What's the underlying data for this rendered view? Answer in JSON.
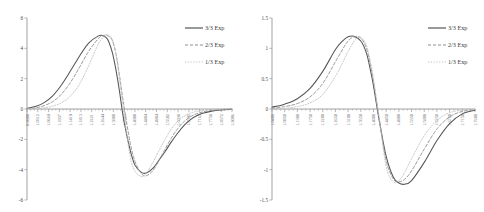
{
  "figure": {
    "panel_count": 2,
    "background": "#ffffff",
    "curve_colors": {
      "exp_3_3": "#555555",
      "exp_2_3": "#8d8d8d",
      "exp_1_3": "#c2c2c2"
    }
  },
  "legend": {
    "position": "top-right",
    "entries": [
      {
        "label": "3/3 Exp",
        "style": "solid"
      },
      {
        "label": "2/3 Exp",
        "style": "dashed"
      },
      {
        "label": "1/3 Exp",
        "style": "dotted"
      }
    ]
  },
  "chart_data": [
    {
      "type": "line",
      "panel": "left",
      "title": "",
      "xlabel": "",
      "ylabel": "",
      "ylim": [
        -6,
        6
      ],
      "yticks": [
        "6",
        "4",
        "2",
        "0",
        "-2",
        "-4",
        "-6"
      ],
      "ytick_values": [
        6,
        4,
        2,
        0,
        -2,
        -4,
        -6
      ],
      "grid": false,
      "legend_position": "top-right",
      "xtick_labels": [
        "0.9908",
        "1.0312",
        "1.0669",
        "1.1037",
        "1.1419",
        "1.1813",
        "1.2221",
        "1.2644",
        "1.3080",
        "1.3532",
        "1.4000",
        "1.4484",
        "1.4984",
        "1.5502",
        "1.6038",
        "1.6592",
        "1.7165",
        "1.7758",
        "1.8372",
        "1.9006"
      ],
      "xlim": [
        0.9908,
        1.9006
      ],
      "series": [
        {
          "name": "3/3 Exp",
          "style": "solid",
          "x": [
            0.9908,
            1.0312,
            1.0669,
            1.1037,
            1.1419,
            1.1813,
            1.2221,
            1.2644,
            1.308,
            1.325,
            1.342,
            1.3532,
            1.37,
            1.386,
            1.4,
            1.42,
            1.4484,
            1.47,
            1.4984,
            1.52,
            1.5502,
            1.58,
            1.6038,
            1.63,
            1.6592,
            1.69,
            1.7165,
            1.75,
            1.7758,
            1.81,
            1.8372,
            1.87,
            1.9006
          ],
          "y": [
            0.05,
            0.18,
            0.42,
            0.85,
            1.55,
            2.45,
            3.45,
            4.35,
            4.82,
            4.85,
            4.7,
            4.45,
            3.7,
            2.55,
            1.3,
            -0.7,
            -2.7,
            -3.7,
            -4.18,
            -4.22,
            -3.9,
            -3.3,
            -2.8,
            -2.2,
            -1.6,
            -1.05,
            -0.7,
            -0.4,
            -0.26,
            -0.14,
            -0.08,
            -0.04,
            -0.02
          ]
        },
        {
          "name": "2/3 Exp",
          "style": "dashed",
          "x": [
            0.9908,
            1.0312,
            1.0669,
            1.1037,
            1.1419,
            1.1813,
            1.2221,
            1.2644,
            1.308,
            1.33,
            1.3532,
            1.37,
            1.386,
            1.4,
            1.42,
            1.4484,
            1.47,
            1.4984,
            1.52,
            1.5502,
            1.58,
            1.6038,
            1.63,
            1.6592,
            1.69,
            1.7165,
            1.75,
            1.7758,
            1.81,
            1.8372,
            1.87,
            1.9006
          ],
          "y": [
            0.02,
            0.08,
            0.22,
            0.48,
            0.95,
            1.7,
            2.7,
            3.8,
            4.65,
            4.85,
            4.8,
            4.5,
            3.6,
            2.35,
            0.3,
            -2.2,
            -3.45,
            -4.25,
            -4.4,
            -4.05,
            -3.3,
            -2.65,
            -1.95,
            -1.3,
            -0.8,
            -0.5,
            -0.28,
            -0.18,
            -0.09,
            -0.05,
            -0.02,
            -0.01
          ]
        },
        {
          "name": "1/3 Exp",
          "style": "dotted",
          "x": [
            0.9908,
            1.0312,
            1.0669,
            1.1037,
            1.1419,
            1.1813,
            1.2221,
            1.2644,
            1.308,
            1.34,
            1.3532,
            1.37,
            1.386,
            1.4,
            1.42,
            1.4484,
            1.47,
            1.4984,
            1.52,
            1.5502,
            1.58,
            1.6038,
            1.63,
            1.6592,
            1.69,
            1.7165,
            1.75,
            1.7758,
            1.81,
            1.8372,
            1.87,
            1.9006
          ],
          "y": [
            0.01,
            0.03,
            0.08,
            0.18,
            0.4,
            0.82,
            1.6,
            2.85,
            4.3,
            4.88,
            4.85,
            4.55,
            3.55,
            2.1,
            -0.2,
            -3.1,
            -4.1,
            -4.45,
            -4.25,
            -3.5,
            -2.65,
            -2.0,
            -1.35,
            -0.82,
            -0.45,
            -0.27,
            -0.14,
            -0.08,
            -0.04,
            -0.02,
            -0.01,
            0.0
          ]
        }
      ]
    },
    {
      "type": "line",
      "panel": "right",
      "title": "",
      "xlabel": "",
      "ylabel": "",
      "ylim": [
        -1.5,
        1.5
      ],
      "yticks": [
        "1.5",
        "1",
        "0.5",
        "0",
        "-0.5",
        "-1",
        "-1.5"
      ],
      "ytick_values": [
        1.5,
        1,
        0.5,
        0,
        -0.5,
        -1,
        -1.5
      ],
      "grid": false,
      "legend_position": "top-right",
      "xtick_labels": [
        "1.0400",
        "1.0850",
        "1.1300",
        "1.1750",
        "1.2200",
        "1.2650",
        "1.3100",
        "1.3550",
        "1.4000",
        "1.4450",
        "1.4900",
        "1.5350",
        "1.5800",
        "1.6250",
        "1.6700",
        "1.7150",
        "1.7600"
      ],
      "xlim": [
        1.04,
        1.76
      ],
      "series": [
        {
          "name": "3/3 Exp",
          "style": "solid",
          "x": [
            1.04,
            1.085,
            1.13,
            1.175,
            1.22,
            1.265,
            1.29,
            1.31,
            1.33,
            1.355,
            1.375,
            1.39,
            1.4,
            1.42,
            1.445,
            1.47,
            1.49,
            1.51,
            1.535,
            1.58,
            1.625,
            1.67,
            1.715,
            1.76
          ],
          "y": [
            0.03,
            0.08,
            0.17,
            0.34,
            0.62,
            0.98,
            1.12,
            1.19,
            1.2,
            1.12,
            0.92,
            0.62,
            0.38,
            -0.18,
            -0.78,
            -1.12,
            -1.22,
            -1.24,
            -1.18,
            -0.88,
            -0.52,
            -0.24,
            -0.08,
            -0.02
          ]
        },
        {
          "name": "2/3 Exp",
          "style": "dashed",
          "x": [
            1.04,
            1.085,
            1.13,
            1.175,
            1.22,
            1.265,
            1.29,
            1.31,
            1.33,
            1.355,
            1.375,
            1.39,
            1.4,
            1.42,
            1.445,
            1.47,
            1.49,
            1.51,
            1.535,
            1.58,
            1.625,
            1.67,
            1.715,
            1.76
          ],
          "y": [
            0.01,
            0.04,
            0.09,
            0.2,
            0.42,
            0.78,
            0.98,
            1.12,
            1.19,
            1.17,
            1.0,
            0.7,
            0.45,
            -0.15,
            -0.85,
            -1.15,
            -1.2,
            -1.16,
            -1.02,
            -0.66,
            -0.33,
            -0.13,
            -0.04,
            -0.01
          ]
        },
        {
          "name": "1/3 Exp",
          "style": "dotted",
          "x": [
            1.04,
            1.085,
            1.13,
            1.175,
            1.22,
            1.265,
            1.29,
            1.31,
            1.335,
            1.355,
            1.375,
            1.39,
            1.4,
            1.42,
            1.445,
            1.47,
            1.49,
            1.51,
            1.535,
            1.58,
            1.625,
            1.67,
            1.715,
            1.76
          ],
          "y": [
            0.0,
            0.01,
            0.04,
            0.1,
            0.24,
            0.54,
            0.76,
            0.95,
            1.14,
            1.18,
            1.05,
            0.76,
            0.5,
            -0.15,
            -0.95,
            -1.2,
            -1.18,
            -1.05,
            -0.82,
            -0.44,
            -0.19,
            -0.06,
            -0.02,
            0.0
          ]
        }
      ]
    }
  ]
}
